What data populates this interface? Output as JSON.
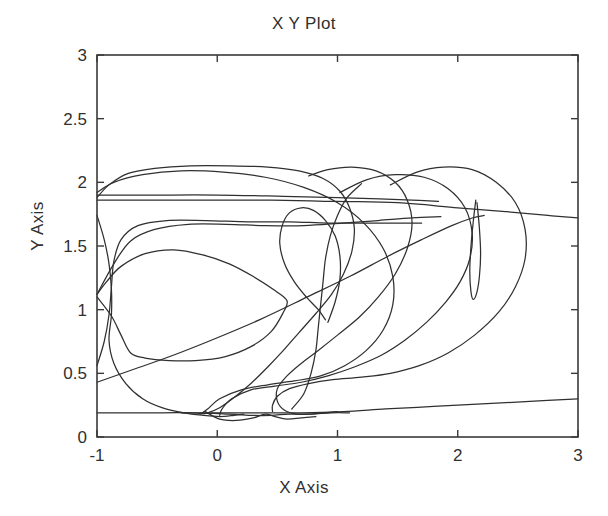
{
  "figure": {
    "title": "X Y Plot",
    "background_color": "#ffffff",
    "line_color": "#303030",
    "axis_color": "#3a3a3a"
  },
  "axes": {
    "x_label": "X Axis",
    "y_label": "Y Axis",
    "x_ticks": [
      "-1",
      "0",
      "1",
      "2",
      "3"
    ],
    "y_ticks": [
      "0",
      "0.5",
      "1",
      "1.5",
      "2",
      "2.5",
      "3"
    ]
  },
  "chart_data": {
    "type": "line",
    "title": "X Y Plot",
    "xlabel": "X Axis",
    "ylabel": "Y Axis",
    "xlim": [
      -1,
      3
    ],
    "ylim": [
      0,
      3
    ],
    "xticks": [
      -1,
      0,
      1,
      2,
      3
    ],
    "yticks": [
      0,
      0.5,
      1,
      1.5,
      2,
      2.5,
      3
    ],
    "grid": false,
    "legend": "none",
    "series": [
      {
        "name": "trajectory-1",
        "points": [
          [
            -1.0,
            1.88
          ],
          [
            -0.9,
            1.98
          ],
          [
            -0.74,
            2.07
          ],
          [
            -0.52,
            2.11
          ],
          [
            -0.22,
            2.13
          ],
          [
            0.1,
            2.13
          ],
          [
            0.42,
            2.12
          ],
          [
            0.68,
            2.09
          ],
          [
            0.88,
            2.03
          ],
          [
            1.02,
            1.93
          ],
          [
            1.1,
            1.8
          ],
          [
            1.14,
            1.64
          ],
          [
            1.12,
            1.46
          ],
          [
            1.05,
            1.28
          ],
          [
            0.95,
            1.12
          ],
          [
            0.82,
            0.97
          ],
          [
            0.68,
            0.82
          ],
          [
            0.55,
            0.68
          ],
          [
            0.42,
            0.55
          ],
          [
            0.28,
            0.42
          ],
          [
            0.14,
            0.31
          ],
          [
            0.02,
            0.23
          ],
          [
            -0.08,
            0.19
          ],
          [
            -0.16,
            0.18
          ]
        ]
      },
      {
        "name": "trajectory-2",
        "points": [
          [
            -1.0,
            1.92
          ],
          [
            -0.86,
            2.0
          ],
          [
            -0.62,
            2.06
          ],
          [
            -0.3,
            2.09
          ],
          [
            0.05,
            2.08
          ],
          [
            0.4,
            2.04
          ],
          [
            0.72,
            1.96
          ],
          [
            1.0,
            1.84
          ],
          [
            1.22,
            1.68
          ],
          [
            1.38,
            1.48
          ],
          [
            1.46,
            1.26
          ],
          [
            1.46,
            1.04
          ],
          [
            1.38,
            0.84
          ],
          [
            1.24,
            0.68
          ],
          [
            1.06,
            0.56
          ],
          [
            0.86,
            0.48
          ],
          [
            0.64,
            0.44
          ],
          [
            0.42,
            0.41
          ],
          [
            0.2,
            0.37
          ],
          [
            0.02,
            0.3
          ],
          [
            -0.08,
            0.22
          ],
          [
            -0.14,
            0.18
          ]
        ]
      },
      {
        "name": "trajectory-3",
        "points": [
          [
            -1.0,
            1.86
          ],
          [
            -0.6,
            1.86
          ],
          [
            -0.1,
            1.86
          ],
          [
            0.45,
            1.86
          ],
          [
            1.0,
            1.85
          ],
          [
            1.5,
            1.84
          ],
          [
            2.0,
            1.8
          ],
          [
            2.4,
            1.77
          ],
          [
            2.75,
            1.74
          ],
          [
            3.0,
            1.72
          ]
        ]
      },
      {
        "name": "trajectory-4",
        "points": [
          [
            -1.0,
            1.9
          ],
          [
            -0.55,
            1.9
          ],
          [
            0.0,
            1.9
          ],
          [
            0.55,
            1.89
          ],
          [
            1.0,
            1.88
          ],
          [
            1.35,
            1.87
          ],
          [
            1.62,
            1.86
          ],
          [
            1.84,
            1.85
          ]
        ]
      },
      {
        "name": "trajectory-5",
        "points": [
          [
            -1.0,
            0.43
          ],
          [
            -0.7,
            0.53
          ],
          [
            -0.4,
            0.63
          ],
          [
            -0.05,
            0.76
          ],
          [
            0.35,
            0.92
          ],
          [
            0.75,
            1.1
          ],
          [
            1.1,
            1.26
          ],
          [
            1.42,
            1.42
          ],
          [
            1.7,
            1.55
          ],
          [
            1.95,
            1.66
          ],
          [
            2.12,
            1.72
          ],
          [
            2.22,
            1.74
          ]
        ]
      },
      {
        "name": "trajectory-6",
        "points": [
          [
            -1.0,
            1.74
          ],
          [
            -0.94,
            1.55
          ],
          [
            -0.9,
            1.36
          ],
          [
            -0.88,
            1.16
          ],
          [
            -0.88,
            0.96
          ],
          [
            -0.9,
            0.76
          ],
          [
            -0.86,
            0.58
          ],
          [
            -0.76,
            0.42
          ],
          [
            -0.62,
            0.3
          ],
          [
            -0.46,
            0.23
          ],
          [
            -0.28,
            0.19
          ],
          [
            -0.12,
            0.17
          ],
          [
            0.02,
            0.16
          ],
          [
            0.14,
            0.17
          ],
          [
            0.22,
            0.18
          ]
        ]
      },
      {
        "name": "trajectory-7",
        "points": [
          [
            -1.0,
            0.56
          ],
          [
            -0.94,
            0.75
          ],
          [
            -0.9,
            0.96
          ],
          [
            -0.88,
            1.18
          ],
          [
            -0.86,
            1.38
          ],
          [
            -0.8,
            1.55
          ],
          [
            -0.66,
            1.66
          ],
          [
            -0.42,
            1.7
          ],
          [
            -0.1,
            1.7
          ],
          [
            0.26,
            1.69
          ],
          [
            0.6,
            1.69
          ],
          [
            0.92,
            1.68
          ],
          [
            1.22,
            1.68
          ],
          [
            1.5,
            1.68
          ],
          [
            1.7,
            1.68
          ]
        ]
      },
      {
        "name": "trajectory-8",
        "points": [
          [
            -1.0,
            1.12
          ],
          [
            -0.86,
            1.36
          ],
          [
            -0.72,
            1.54
          ],
          [
            -0.52,
            1.63
          ],
          [
            -0.24,
            1.67
          ],
          [
            0.08,
            1.67
          ],
          [
            0.4,
            1.66
          ],
          [
            0.72,
            1.66
          ],
          [
            1.04,
            1.68
          ],
          [
            1.34,
            1.7
          ],
          [
            1.62,
            1.72
          ],
          [
            1.86,
            1.73
          ]
        ]
      },
      {
        "name": "trajectory-9",
        "points": [
          [
            -1.0,
            1.1
          ],
          [
            -0.88,
            0.95
          ],
          [
            -0.8,
            0.8
          ],
          [
            -0.72,
            0.66
          ],
          [
            -0.6,
            0.62
          ],
          [
            -0.4,
            0.6
          ],
          [
            -0.18,
            0.6
          ],
          [
            0.06,
            0.63
          ],
          [
            0.28,
            0.71
          ],
          [
            0.45,
            0.83
          ],
          [
            0.55,
            0.98
          ],
          [
            0.58,
            1.07
          ],
          [
            0.48,
            1.15
          ],
          [
            0.3,
            1.26
          ],
          [
            0.1,
            1.36
          ],
          [
            -0.12,
            1.43
          ],
          [
            -0.36,
            1.47
          ],
          [
            -0.6,
            1.44
          ],
          [
            -0.8,
            1.34
          ],
          [
            -0.92,
            1.22
          ],
          [
            -1.0,
            1.12
          ]
        ]
      },
      {
        "name": "trajectory-10",
        "points": [
          [
            0.76,
            2.05
          ],
          [
            0.92,
            2.1
          ],
          [
            1.12,
            2.12
          ],
          [
            1.32,
            2.09
          ],
          [
            1.48,
            2.0
          ],
          [
            1.58,
            1.86
          ],
          [
            1.62,
            1.68
          ],
          [
            1.58,
            1.48
          ],
          [
            1.48,
            1.28
          ],
          [
            1.34,
            1.1
          ],
          [
            1.18,
            0.94
          ],
          [
            1.0,
            0.8
          ],
          [
            0.84,
            0.68
          ],
          [
            0.7,
            0.58
          ],
          [
            0.58,
            0.48
          ],
          [
            0.5,
            0.38
          ],
          [
            0.5,
            0.28
          ],
          [
            0.56,
            0.21
          ],
          [
            0.66,
            0.18
          ],
          [
            0.78,
            0.18
          ],
          [
            0.9,
            0.19
          ],
          [
            1.0,
            0.2
          ]
        ]
      },
      {
        "name": "trajectory-11",
        "points": [
          [
            1.02,
            1.92
          ],
          [
            1.24,
            2.02
          ],
          [
            1.48,
            2.06
          ],
          [
            1.72,
            2.04
          ],
          [
            1.92,
            1.95
          ],
          [
            2.06,
            1.8
          ],
          [
            2.12,
            1.6
          ],
          [
            2.1,
            1.4
          ],
          [
            2.02,
            1.22
          ],
          [
            1.9,
            1.06
          ],
          [
            1.74,
            0.9
          ],
          [
            1.56,
            0.76
          ],
          [
            1.36,
            0.64
          ],
          [
            1.14,
            0.55
          ],
          [
            0.92,
            0.48
          ],
          [
            0.7,
            0.43
          ],
          [
            0.48,
            0.4
          ],
          [
            0.28,
            0.37
          ],
          [
            0.12,
            0.3
          ],
          [
            0.04,
            0.22
          ],
          [
            0.02,
            0.17
          ]
        ]
      },
      {
        "name": "trajectory-12",
        "points": [
          [
            1.44,
            1.98
          ],
          [
            1.66,
            2.08
          ],
          [
            1.88,
            2.12
          ],
          [
            2.12,
            2.1
          ],
          [
            2.32,
            2.0
          ],
          [
            2.48,
            1.84
          ],
          [
            2.56,
            1.63
          ],
          [
            2.56,
            1.4
          ],
          [
            2.48,
            1.18
          ],
          [
            2.34,
            0.98
          ],
          [
            2.14,
            0.8
          ],
          [
            1.92,
            0.66
          ],
          [
            1.68,
            0.56
          ],
          [
            1.44,
            0.5
          ],
          [
            1.2,
            0.47
          ],
          [
            0.96,
            0.45
          ],
          [
            0.76,
            0.42
          ],
          [
            0.6,
            0.38
          ],
          [
            0.5,
            0.32
          ],
          [
            0.46,
            0.25
          ],
          [
            0.46,
            0.2
          ]
        ]
      },
      {
        "name": "trajectory-13",
        "points": [
          [
            2.16,
            1.84
          ],
          [
            2.18,
            1.64
          ],
          [
            2.19,
            1.44
          ],
          [
            2.18,
            1.26
          ],
          [
            2.16,
            1.14
          ],
          [
            2.13,
            1.08
          ],
          [
            2.11,
            1.14
          ],
          [
            2.1,
            1.3
          ],
          [
            2.11,
            1.5
          ],
          [
            2.13,
            1.7
          ],
          [
            2.15,
            1.86
          ]
        ]
      },
      {
        "name": "trajectory-14",
        "points": [
          [
            -0.3,
            0.19
          ],
          [
            0.0,
            0.19
          ],
          [
            0.35,
            0.19
          ],
          [
            0.7,
            0.19
          ],
          [
            1.05,
            0.2
          ],
          [
            1.4,
            0.22
          ],
          [
            1.8,
            0.24
          ],
          [
            2.2,
            0.26
          ],
          [
            2.6,
            0.28
          ],
          [
            3.0,
            0.3
          ]
        ]
      },
      {
        "name": "trajectory-15",
        "points": [
          [
            -1.0,
            0.19
          ],
          [
            -0.6,
            0.19
          ],
          [
            -0.2,
            0.19
          ],
          [
            0.1,
            0.18
          ],
          [
            0.3,
            0.17
          ],
          [
            0.45,
            0.17
          ],
          [
            0.6,
            0.18
          ],
          [
            0.78,
            0.18
          ],
          [
            0.95,
            0.19
          ],
          [
            1.1,
            0.19
          ]
        ]
      },
      {
        "name": "trajectory-16",
        "points": [
          [
            -0.1,
            0.2
          ],
          [
            0.02,
            0.14
          ],
          [
            0.16,
            0.13
          ],
          [
            0.3,
            0.15
          ],
          [
            0.4,
            0.18
          ],
          [
            0.48,
            0.16
          ],
          [
            0.58,
            0.14
          ],
          [
            0.7,
            0.15
          ],
          [
            0.82,
            0.16
          ]
        ]
      },
      {
        "name": "trajectory-17",
        "points": [
          [
            0.62,
            0.22
          ],
          [
            0.72,
            0.34
          ],
          [
            0.78,
            0.5
          ],
          [
            0.82,
            0.68
          ],
          [
            0.84,
            0.86
          ],
          [
            0.86,
            1.04
          ],
          [
            0.88,
            1.22
          ],
          [
            0.9,
            1.4
          ],
          [
            0.94,
            1.58
          ],
          [
            1.0,
            1.74
          ],
          [
            1.08,
            1.88
          ],
          [
            1.2,
            1.99
          ]
        ]
      },
      {
        "name": "trajectory-18",
        "points": [
          [
            0.92,
            0.9
          ],
          [
            0.98,
            1.06
          ],
          [
            1.02,
            1.24
          ],
          [
            1.02,
            1.42
          ],
          [
            0.98,
            1.58
          ],
          [
            0.9,
            1.7
          ],
          [
            0.8,
            1.78
          ],
          [
            0.7,
            1.8
          ],
          [
            0.6,
            1.76
          ],
          [
            0.54,
            1.66
          ],
          [
            0.52,
            1.52
          ],
          [
            0.56,
            1.36
          ],
          [
            0.64,
            1.22
          ],
          [
            0.74,
            1.1
          ],
          [
            0.84,
            1.0
          ],
          [
            0.9,
            0.92
          ]
        ]
      }
    ]
  }
}
